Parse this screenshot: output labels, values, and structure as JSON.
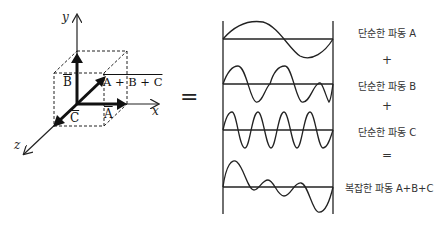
{
  "vector_diagram": {
    "axes": {
      "x": "x",
      "y": "y",
      "z": "z"
    },
    "vectors": {
      "A": "A",
      "B": "B",
      "C": "C",
      "sum": "A + B + C"
    }
  },
  "equals_sign": "=",
  "waves": {
    "labels": [
      {
        "text": "단순한 파동 A"
      },
      {
        "text": "단순한 파동 B"
      },
      {
        "text": "단순한 파동 C"
      },
      {
        "text": "복잡한 파동 A+B+C"
      }
    ],
    "operators": [
      "+",
      "+",
      "="
    ]
  }
}
